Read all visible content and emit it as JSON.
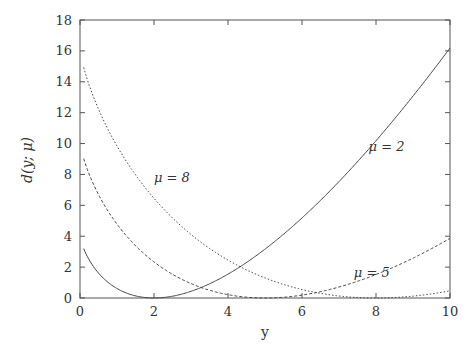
{
  "chart_data": {
    "type": "line",
    "title": "",
    "xlabel": "y",
    "ylabel": "d(y; μ)",
    "xlim": [
      0,
      10
    ],
    "ylim": [
      0,
      18
    ],
    "xticks": [
      0,
      2,
      4,
      6,
      8,
      10
    ],
    "yticks": [
      0,
      2,
      4,
      6,
      8,
      10,
      12,
      14,
      16,
      18
    ],
    "grid": false,
    "legend": "none (inline curve labels)",
    "formula": "d(y; μ) = 2[y ln(y/μ) − (y − μ)]",
    "x_range_plotted": [
      0.1,
      10
    ],
    "series": [
      {
        "name": "μ = 2",
        "mu": 2,
        "style": "solid",
        "label_pos": {
          "x": 7.8,
          "y": 9.8
        },
        "sample_points": [
          [
            0.1,
            3.2
          ],
          [
            1,
            0.61
          ],
          [
            2,
            0.0
          ],
          [
            4,
            1.55
          ],
          [
            6,
            5.18
          ],
          [
            8,
            10.18
          ],
          [
            10,
            16.19
          ]
        ]
      },
      {
        "name": "μ = 5",
        "mu": 5,
        "style": "dashed",
        "label_pos": {
          "x": 7.4,
          "y": 1.6
        },
        "sample_points": [
          [
            0.1,
            9.02
          ],
          [
            1,
            4.78
          ],
          [
            2,
            2.33
          ],
          [
            4,
            0.21
          ],
          [
            5,
            0.0
          ],
          [
            6,
            0.19
          ],
          [
            8,
            1.52
          ],
          [
            10,
            3.86
          ]
        ]
      },
      {
        "name": "μ = 8",
        "mu": 8,
        "style": "dotted",
        "label_pos": {
          "x": 2.0,
          "y": 7.8
        },
        "sample_points": [
          [
            0.1,
            14.92
          ],
          [
            1,
            9.84
          ],
          [
            2,
            6.45
          ],
          [
            4,
            2.45
          ],
          [
            6,
            0.55
          ],
          [
            8,
            0.0
          ],
          [
            10,
            0.46
          ]
        ]
      }
    ]
  },
  "labels": {
    "xlabel": "y",
    "ylabel": "d(y; μ)",
    "curves": [
      "μ = 2",
      "μ = 5",
      "μ = 8"
    ]
  }
}
